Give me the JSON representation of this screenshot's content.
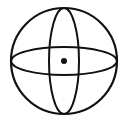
{
  "figure": {
    "colors": {
      "background": "#ffffff",
      "stroke": "#111111",
      "dot": "#111111"
    },
    "outer_circle": {
      "cx": 64,
      "cy": 61,
      "r": 53
    },
    "meridian_ellipse": {
      "cx": 64,
      "cy": 61,
      "rx": 15,
      "ry": 53
    },
    "equator_ellipse": {
      "cx": 64,
      "cy": 61,
      "rx": 53,
      "ry": 14
    },
    "center_dot": {
      "cx": 64,
      "cy": 61,
      "r": 3
    }
  }
}
